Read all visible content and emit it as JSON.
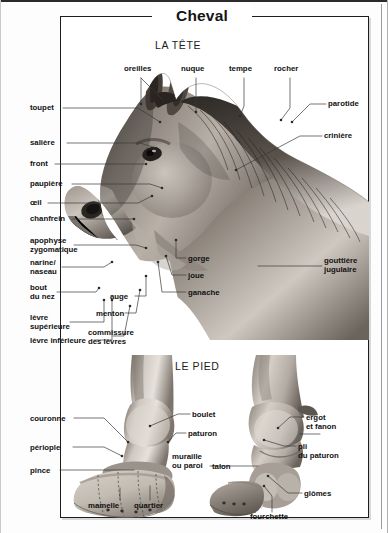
{
  "document": {
    "title": "Cheval",
    "sections": [
      {
        "id": "head",
        "title": "LA TÊTE"
      },
      {
        "id": "foot",
        "title": "LE PIED"
      }
    ]
  },
  "head_labels": {
    "oreilles": "oreilles",
    "nuque": "nuque",
    "tempe": "tempe",
    "rocher": "rocher",
    "parotide": "parotide",
    "criniere": "crinière",
    "gouttiere_jugulaire": "gouttière\njugulaire",
    "toupet": "toupet",
    "saliere": "salière",
    "front": "front",
    "paupiere": "paupière",
    "oeil": "œil",
    "chanfrein": "chanfrein",
    "apophyse_zygomatique": "apophyse\nzygomatique",
    "narine_naseau": "narine/\nnaseau",
    "bout_du_nez": "bout\ndu nez",
    "levre_superieure": "lèvre\nsupérieure",
    "levre_inferieure": "lèvre inférieure",
    "commissure_des_levres": "commissure\ndes lèvres",
    "menton": "menton",
    "auge": "auge",
    "gorge": "gorge",
    "joue": "joue",
    "ganache": "ganache"
  },
  "foot_labels": {
    "boulet": "boulet",
    "paturon": "paturon",
    "couronne": "couronne",
    "periople": "périople",
    "pince": "pince",
    "mamelle": "mamelle",
    "quartier": "quartier",
    "muraille_ou_paroi": "muraille\nou paroi",
    "talon": "talon",
    "ergot_et_fanon": "ergot\net fanon",
    "pli_du_paturon": "pli\ndu paturon",
    "glomes": "glômes",
    "fourchette": "fourchette"
  },
  "colors": {
    "frame": "#1c1c1c",
    "text": "#111111",
    "leader": "#3a3a3a",
    "page_bg": "#fdfdfd"
  }
}
